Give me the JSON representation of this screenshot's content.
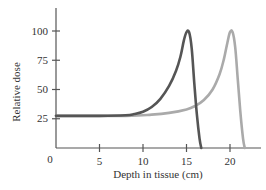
{
  "chart_data": {
    "type": "line",
    "title": "",
    "xlabel": "Depth in tissue (cm)",
    "ylabel": "Relative dose",
    "xlim": [
      0,
      23.5
    ],
    "ylim": [
      0,
      120
    ],
    "grid": false,
    "legend": null,
    "x_ticks": [
      0,
      5,
      10,
      15,
      20
    ],
    "x_tick_labels": [
      "0",
      "5",
      "10",
      "15",
      "20"
    ],
    "y_ticks": [
      25,
      50,
      75,
      100
    ],
    "y_tick_labels": [
      "25",
      "50",
      "75",
      "100"
    ],
    "series": [
      {
        "name": "Bragg peak at 15 cm",
        "color": "#555555",
        "points": [
          [
            0,
            27.5
          ],
          [
            5,
            27.5
          ],
          [
            8,
            28
          ],
          [
            9,
            29
          ],
          [
            10,
            31
          ],
          [
            11,
            35
          ],
          [
            12,
            42
          ],
          [
            13,
            53
          ],
          [
            13.8,
            66
          ],
          [
            14.3,
            78
          ],
          [
            14.7,
            92
          ],
          [
            15,
            99
          ],
          [
            15.3,
            99
          ],
          [
            15.6,
            85
          ],
          [
            15.9,
            55
          ],
          [
            16.2,
            28
          ],
          [
            16.5,
            8
          ],
          [
            16.7,
            0
          ]
        ]
      },
      {
        "name": "Bragg peak at 20 cm",
        "color": "#aaaaaa",
        "points": [
          [
            0,
            27.5
          ],
          [
            8,
            27.5
          ],
          [
            11,
            28.5
          ],
          [
            13,
            30
          ],
          [
            15,
            33
          ],
          [
            16,
            36
          ],
          [
            17,
            41
          ],
          [
            18,
            50
          ],
          [
            18.8,
            63
          ],
          [
            19.3,
            76
          ],
          [
            19.7,
            90
          ],
          [
            20,
            99
          ],
          [
            20.3,
            99
          ],
          [
            20.6,
            86
          ],
          [
            20.9,
            58
          ],
          [
            21.2,
            30
          ],
          [
            21.5,
            8
          ],
          [
            21.7,
            0
          ]
        ]
      }
    ]
  }
}
